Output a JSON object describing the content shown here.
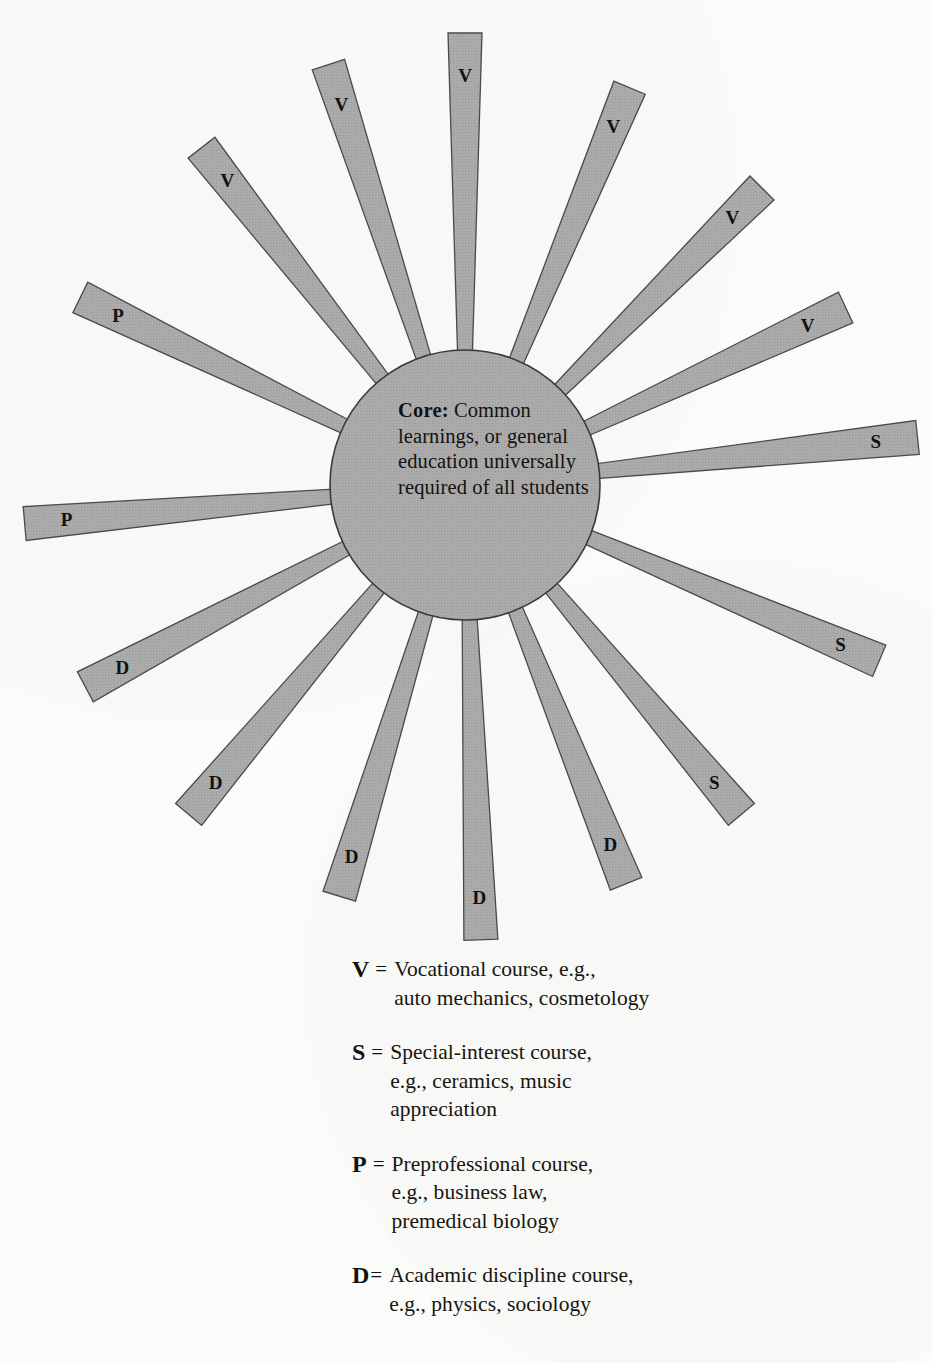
{
  "diagram": {
    "type": "radial-core-curriculum",
    "core": {
      "label": "Core:",
      "text": " Common\nlearnings, or\ngeneral education\nuniversally\nrequired of\nall students",
      "full_text": "Core: Common learnings, or general education universally required of all students",
      "center_x": 465,
      "center_y": 485,
      "radius": 135,
      "fill": "#a9a9a9",
      "stroke": "#3a3a3a"
    },
    "ray_style": {
      "fill": "#a9a9a9",
      "stroke": "#4a4a4a",
      "inner_radius": 118,
      "inner_half_width": 7,
      "outer_half_width": 17
    },
    "rays": [
      {
        "label": "V",
        "angle_deg": -90,
        "length": 452
      },
      {
        "label": "V",
        "angle_deg": -67.5,
        "length": 430
      },
      {
        "label": "V",
        "angle_deg": -45,
        "length": 420
      },
      {
        "label": "V",
        "angle_deg": -25,
        "length": 420
      },
      {
        "label": "S",
        "angle_deg": -6,
        "length": 455
      },
      {
        "label": "S",
        "angle_deg": 23,
        "length": 450
      },
      {
        "label": "S",
        "angle_deg": 50,
        "length": 430
      },
      {
        "label": "D",
        "angle_deg": 68,
        "length": 430
      },
      {
        "label": "D",
        "angle_deg": 88,
        "length": 455
      },
      {
        "label": "D",
        "angle_deg": 107,
        "length": 430
      },
      {
        "label": "D",
        "angle_deg": 130,
        "length": 430
      },
      {
        "label": "D",
        "angle_deg": 152,
        "length": 430
      },
      {
        "label": "P",
        "angle_deg": 175,
        "length": 442
      },
      {
        "label": "P",
        "angle_deg": -154,
        "length": 428
      },
      {
        "label": "V",
        "angle_deg": -128,
        "length": 428
      },
      {
        "label": "V",
        "angle_deg": -108,
        "length": 442
      }
    ],
    "label_counts": {
      "V": 6,
      "S": 3,
      "P": 2,
      "D": 5
    },
    "label_font_size": 19
  },
  "legend": {
    "entries": [
      {
        "key": "V",
        "equals": "=",
        "tight": false,
        "description": "Vocational course, e.g.,\nauto mechanics, cosmetology"
      },
      {
        "key": "S",
        "equals": "=",
        "tight": false,
        "description": "Special-interest course,\ne.g., ceramics, music\nappreciation"
      },
      {
        "key": "P",
        "equals": "=",
        "tight": false,
        "description": "Preprofessional course,\ne.g., business law,\npremedical biology"
      },
      {
        "key": "D",
        "equals": "=",
        "tight": true,
        "description": "Academic discipline course,\ne.g., physics, sociology"
      }
    ]
  },
  "colors": {
    "background": "#fbfbf9",
    "shape_fill": "#a9a9a9",
    "shape_stroke": "#4a4a4a",
    "text": "#17150f"
  }
}
